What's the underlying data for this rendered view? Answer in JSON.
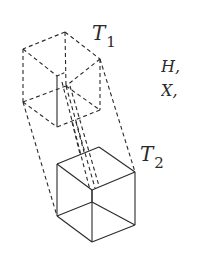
{
  "figure": {
    "upper_cube": {
      "label_main": "T",
      "label_sub": "1",
      "style": "dashed"
    },
    "lower_cube": {
      "label_main": "T",
      "label_sub": "2",
      "style": "solid"
    },
    "side_text": {
      "line1": "H,",
      "line2": "X,"
    },
    "colors": {
      "stroke": "#2a2a2a",
      "background": "#ffffff"
    }
  }
}
